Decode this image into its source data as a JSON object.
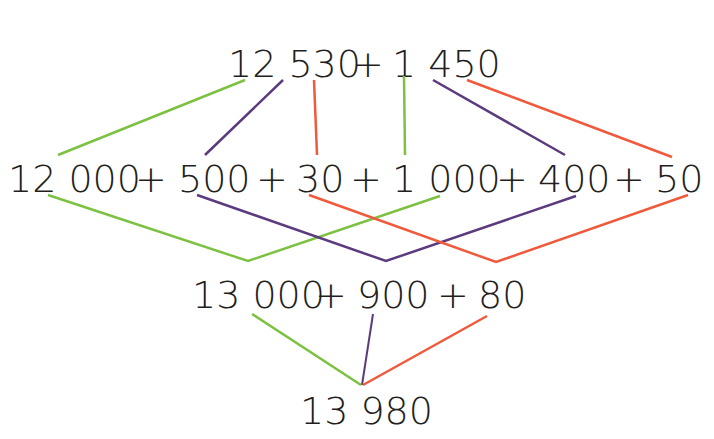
{
  "diagram": {
    "type": "partitioning-addition",
    "colors": {
      "green": "#7dc142",
      "purple": "#5b3a7e",
      "red": "#f05a3c",
      "text": "#231f20"
    },
    "rows": [
      {
        "id": "row1",
        "text": "12 530 + 1 450"
      },
      {
        "id": "row2",
        "text": "12 000 + 500 + 30 + 1 000 + 400 + 50"
      },
      {
        "id": "row3",
        "text": "13 000 + 900 + 80"
      },
      {
        "id": "row4",
        "text": "13 980"
      }
    ],
    "row1": {
      "a": "12 530",
      "plus": "+",
      "b": "1 450"
    },
    "row2": {
      "t1": "12 000",
      "t2": "500",
      "t3": "30",
      "t4": "1 000",
      "t5": "400",
      "t6": "50",
      "plus": "+"
    },
    "row3": {
      "t1": "13 000",
      "t2": "900",
      "t3": "80",
      "plus": "+"
    },
    "row4": {
      "result": "13 980"
    }
  }
}
